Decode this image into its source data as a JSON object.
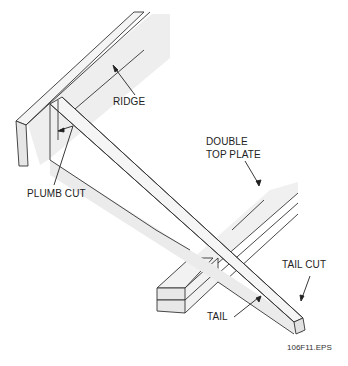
{
  "diagram": {
    "type": "isometric-framing-illustration",
    "labels": {
      "ridge": "RIDGE",
      "plumb_cut": "PLUMB CUT",
      "double_top_plate_line1": "DOUBLE",
      "double_top_plate_line2": "TOP PLATE",
      "tail_cut": "TAIL CUT",
      "tail": "TAIL"
    },
    "figure_id": "106F11.EPS",
    "colors": {
      "fill_face": "#e9e9e9",
      "fill_light": "#f3f3f3",
      "stroke": "#333333",
      "text": "#222222"
    }
  }
}
